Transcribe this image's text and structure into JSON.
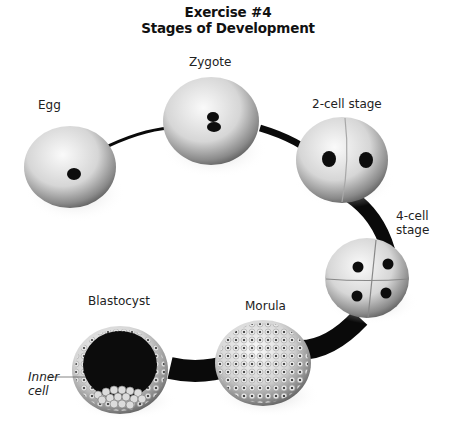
{
  "title": {
    "line1": "Exercise #4",
    "line2": "Stages of Development"
  },
  "stages": [
    {
      "id": "egg",
      "label": "Egg"
    },
    {
      "id": "zygote",
      "label": "Zygote"
    },
    {
      "id": "two-cell",
      "label": "2-cell stage"
    },
    {
      "id": "four-cell",
      "label_line1": "4-cell",
      "label_line2": "stage"
    },
    {
      "id": "morula",
      "label": "Morula"
    },
    {
      "id": "blastocyst",
      "label": "Blastocyst"
    }
  ],
  "annotation": {
    "line1": "Inner",
    "line2": "cell"
  },
  "colors": {
    "path": "#0a0a0a",
    "cell_light": "#f4f4f4",
    "cell_dark": "#5a5a5a",
    "nucleus": "#0d0d0d"
  }
}
